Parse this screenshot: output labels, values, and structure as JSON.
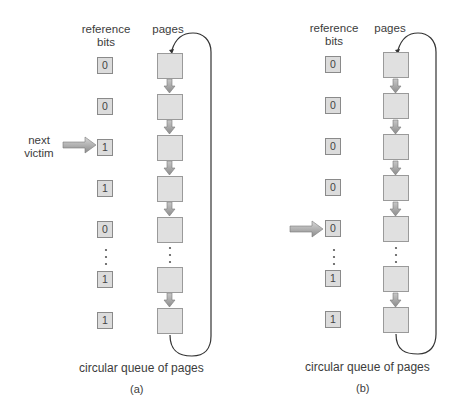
{
  "colors": {
    "box_fill": "#dcdcdc",
    "box_border": "#8a8a8a",
    "arrow": "#9a9a9a",
    "line": "#333333"
  },
  "panels": [
    {
      "id": "a",
      "header_bits": "reference\nbits",
      "header_bits_line1": "reference",
      "header_bits_line2": "bits",
      "header_pages": "pages",
      "bits": [
        "0",
        "0",
        "1",
        "1",
        "0",
        "1",
        "1"
      ],
      "pointer_row": 2,
      "pointer_label_line1": "next",
      "pointer_label_line2": "victim",
      "caption": "circular queue of pages",
      "label": "(a)"
    },
    {
      "id": "b",
      "header_bits_line1": "reference",
      "header_bits_line2": "bits",
      "header_pages": "pages",
      "bits": [
        "0",
        "0",
        "0",
        "0",
        "0",
        "1",
        "1"
      ],
      "pointer_row": 4,
      "caption": "circular queue of pages",
      "label": "(b)"
    }
  ],
  "icons": {
    "pointer": "right-arrow-icon",
    "link": "down-arrow-icon",
    "ellipsis": "vertical-dots-icon"
  }
}
